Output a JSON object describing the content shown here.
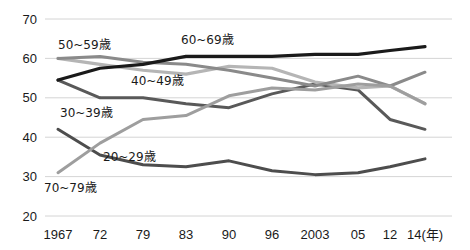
{
  "chart_data": {
    "type": "line",
    "title": "",
    "subtitle": "",
    "xlabel": "(年)",
    "ylabel": "",
    "grid": true,
    "legend_position": "inline-labels",
    "ylim": [
      20,
      70
    ],
    "yticks": [
      70,
      60,
      50,
      40,
      30,
      20
    ],
    "categories": [
      "1967",
      "72",
      "79",
      "83",
      "90",
      "96",
      "2003",
      "05",
      "12",
      "14"
    ],
    "x_tick_labels": [
      "1967",
      "72",
      "79",
      "83",
      "90",
      "96",
      "2003",
      "05",
      "12",
      "14(年)"
    ],
    "series": [
      {
        "name": "20~29歳",
        "color": "#4d4d4d",
        "width": 3.0,
        "values": [
          42.0,
          35.5,
          33.0,
          32.5,
          34.0,
          31.5,
          30.5,
          31.0,
          32.5,
          34.5
        ]
      },
      {
        "name": "30~39歳",
        "color": "#595959",
        "width": 3.0,
        "values": [
          54.5,
          50.0,
          50.0,
          48.5,
          47.5,
          51.0,
          53.5,
          52.0,
          44.5,
          42.0
        ]
      },
      {
        "name": "40~49歳",
        "color": "#b5b5b5",
        "width": 3.2,
        "values": [
          60.0,
          58.5,
          57.0,
          56.0,
          58.0,
          57.5,
          54.0,
          52.5,
          53.0,
          48.5
        ]
      },
      {
        "name": "50~59歳",
        "color": "#8a8a8a",
        "width": 3.0,
        "values": [
          60.0,
          60.5,
          59.0,
          58.5,
          57.0,
          55.0,
          53.0,
          55.5,
          53.0,
          56.5
        ]
      },
      {
        "name": "60~69歳",
        "color": "#1a1a1a",
        "width": 3.2,
        "values": [
          54.5,
          57.5,
          58.5,
          60.5,
          60.5,
          60.5,
          61.0,
          61.0,
          62.0,
          63.0
        ]
      },
      {
        "name": "70~79歳",
        "color": "#9e9e9e",
        "width": 3.0,
        "values": [
          31.0,
          38.5,
          44.5,
          45.5,
          50.5,
          52.5,
          52.0,
          53.5,
          53.0,
          48.5
        ]
      }
    ],
    "inline_labels": [
      {
        "text": "50~59歳",
        "x": 58,
        "y": 49
      },
      {
        "text": "60~69歳",
        "x": 181,
        "y": 44
      },
      {
        "text": "40~49歳",
        "x": 131,
        "y": 85
      },
      {
        "text": "30~39歳",
        "x": 60,
        "y": 117
      },
      {
        "text": "20~29歳",
        "x": 103,
        "y": 161
      },
      {
        "text": "70~79歳",
        "x": 44,
        "y": 192
      }
    ]
  }
}
